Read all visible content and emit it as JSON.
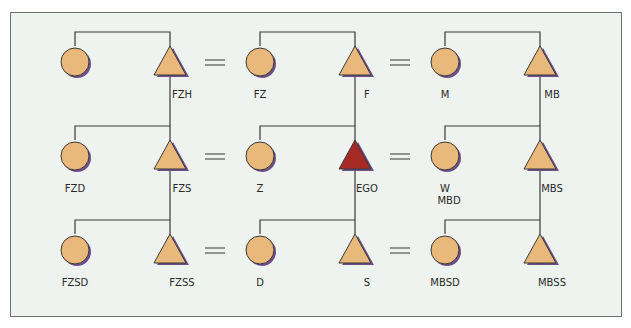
{
  "diagram": {
    "colors": {
      "node_fill": "#e8b97a",
      "ego_fill": "#a52a24",
      "stroke": "#3a3a3a",
      "shadow": "#6c4f8a",
      "background": "#eef3ef"
    },
    "nodes": [
      {
        "id": "fzm",
        "shape": "circle",
        "x": 75,
        "y": 62,
        "label": ""
      },
      {
        "id": "fzh",
        "shape": "triangle",
        "x": 170,
        "y": 62,
        "label": "FZH"
      },
      {
        "id": "fz",
        "shape": "circle",
        "x": 260,
        "y": 62,
        "label": "FZ"
      },
      {
        "id": "f",
        "shape": "triangle",
        "x": 355,
        "y": 62,
        "label": "F"
      },
      {
        "id": "m",
        "shape": "circle",
        "x": 445,
        "y": 62,
        "label": "M"
      },
      {
        "id": "mb",
        "shape": "triangle",
        "x": 540,
        "y": 62,
        "label": "MB"
      },
      {
        "id": "fzd",
        "shape": "circle",
        "x": 75,
        "y": 156,
        "label": "FZD"
      },
      {
        "id": "fzs",
        "shape": "triangle",
        "x": 170,
        "y": 156,
        "label": "FZS"
      },
      {
        "id": "z",
        "shape": "circle",
        "x": 260,
        "y": 156,
        "label": "Z"
      },
      {
        "id": "ego",
        "shape": "triangle",
        "x": 355,
        "y": 156,
        "label": "EGO",
        "ego": true
      },
      {
        "id": "w",
        "shape": "circle",
        "x": 445,
        "y": 156,
        "label": "W",
        "label2": "MBD"
      },
      {
        "id": "mbs",
        "shape": "triangle",
        "x": 540,
        "y": 156,
        "label": "MBS"
      },
      {
        "id": "fzsd",
        "shape": "circle",
        "x": 75,
        "y": 250,
        "label": "FZSD"
      },
      {
        "id": "fzss",
        "shape": "triangle",
        "x": 170,
        "y": 250,
        "label": "FZSS"
      },
      {
        "id": "d",
        "shape": "circle",
        "x": 260,
        "y": 250,
        "label": "D"
      },
      {
        "id": "s",
        "shape": "triangle",
        "x": 355,
        "y": 250,
        "label": "S"
      },
      {
        "id": "mbsd",
        "shape": "circle",
        "x": 445,
        "y": 250,
        "label": "MBSD"
      },
      {
        "id": "mbss",
        "shape": "triangle",
        "x": 540,
        "y": 250,
        "label": "MBSS"
      }
    ],
    "marriages": [
      {
        "x": 215,
        "y": 62
      },
      {
        "x": 400,
        "y": 62
      },
      {
        "x": 215,
        "y": 156
      },
      {
        "x": 400,
        "y": 156
      },
      {
        "x": 215,
        "y": 250
      },
      {
        "x": 400,
        "y": 250
      }
    ],
    "sibling_bars": [
      {
        "x1": 75,
        "x2": 170,
        "y": 32,
        "parent_x": null
      },
      {
        "x1": 260,
        "x2": 355,
        "y": 32,
        "parent_x": null
      },
      {
        "x1": 445,
        "x2": 540,
        "y": 32,
        "parent_x": null
      },
      {
        "x1": 75,
        "x2": 170,
        "y": 126,
        "parent_x": 170
      },
      {
        "x1": 260,
        "x2": 355,
        "y": 126,
        "parent_x": 355
      },
      {
        "x1": 445,
        "x2": 540,
        "y": 126,
        "parent_x": 540
      },
      {
        "x1": 75,
        "x2": 170,
        "y": 220,
        "parent_x": 170
      },
      {
        "x1": 260,
        "x2": 355,
        "y": 220,
        "parent_x": 355
      },
      {
        "x1": 445,
        "x2": 540,
        "y": 220,
        "parent_x": 540
      }
    ]
  }
}
